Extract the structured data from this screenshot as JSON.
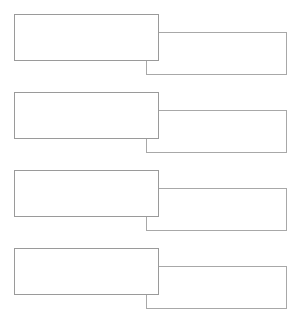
{
  "canvas": {
    "width": 298,
    "height": 326,
    "background_color": "#ffffff",
    "description": "blank-overlapping-rectangle-pairs"
  },
  "style": {
    "border_color_primary": "#9a9a9a",
    "border_color_secondary": "#a8a8a8",
    "fill_color": "#ffffff",
    "border_width_px": 1
  },
  "rows": [
    {
      "row_index": 1,
      "top": 14,
      "primary_box": {
        "label": "",
        "x": 14,
        "y": 14,
        "width": 145,
        "height": 47
      },
      "secondary_box": {
        "label": "",
        "x": 146,
        "y": 32,
        "width": 141,
        "height": 43
      }
    },
    {
      "row_index": 2,
      "top": 92,
      "primary_box": {
        "label": "",
        "x": 14,
        "y": 92,
        "width": 145,
        "height": 47
      },
      "secondary_box": {
        "label": "",
        "x": 146,
        "y": 110,
        "width": 141,
        "height": 43
      }
    },
    {
      "row_index": 3,
      "top": 170,
      "primary_box": {
        "label": "",
        "x": 14,
        "y": 170,
        "width": 145,
        "height": 47
      },
      "secondary_box": {
        "label": "",
        "x": 146,
        "y": 188,
        "width": 141,
        "height": 43
      }
    },
    {
      "row_index": 4,
      "top": 248,
      "primary_box": {
        "label": "",
        "x": 14,
        "y": 248,
        "width": 145,
        "height": 47
      },
      "secondary_box": {
        "label": "",
        "x": 146,
        "y": 266,
        "width": 141,
        "height": 43
      }
    }
  ]
}
